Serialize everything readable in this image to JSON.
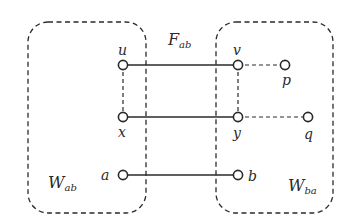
{
  "diagram": {
    "regions": [
      {
        "id": "W_ab",
        "label": "W",
        "subscript": "ab",
        "x": 28,
        "y": 22,
        "w": 118,
        "h": 191
      },
      {
        "id": "W_ba",
        "label": "W",
        "subscript": "ba",
        "x": 216,
        "y": 22,
        "w": 117,
        "h": 191
      }
    ],
    "edge_set_label": {
      "label": "F",
      "subscript": "ab"
    },
    "nodes": [
      {
        "id": "u",
        "label": "u",
        "x": 123,
        "y": 65
      },
      {
        "id": "x",
        "label": "x",
        "x": 123,
        "y": 117
      },
      {
        "id": "a",
        "label": "a",
        "x": 123,
        "y": 175
      },
      {
        "id": "v",
        "label": "v",
        "x": 238,
        "y": 65
      },
      {
        "id": "y",
        "label": "y",
        "x": 238,
        "y": 117
      },
      {
        "id": "b",
        "label": "b",
        "x": 238,
        "y": 175
      },
      {
        "id": "p",
        "label": "p",
        "x": 285,
        "y": 65
      },
      {
        "id": "q",
        "label": "q",
        "x": 308,
        "y": 117
      }
    ],
    "edges": [
      {
        "from": "u",
        "to": "v",
        "style": "solid"
      },
      {
        "from": "x",
        "to": "y",
        "style": "solid"
      },
      {
        "from": "a",
        "to": "b",
        "style": "solid"
      },
      {
        "from": "u",
        "to": "x",
        "style": "dashed"
      },
      {
        "from": "v",
        "to": "y",
        "style": "dashed"
      },
      {
        "from": "v",
        "to": "p",
        "style": "dashed"
      },
      {
        "from": "y",
        "to": "q",
        "style": "dashed"
      }
    ],
    "colors": {
      "stroke": "#2a2a2a",
      "background": "#ffffff",
      "node_fill": "#ffffff"
    }
  }
}
